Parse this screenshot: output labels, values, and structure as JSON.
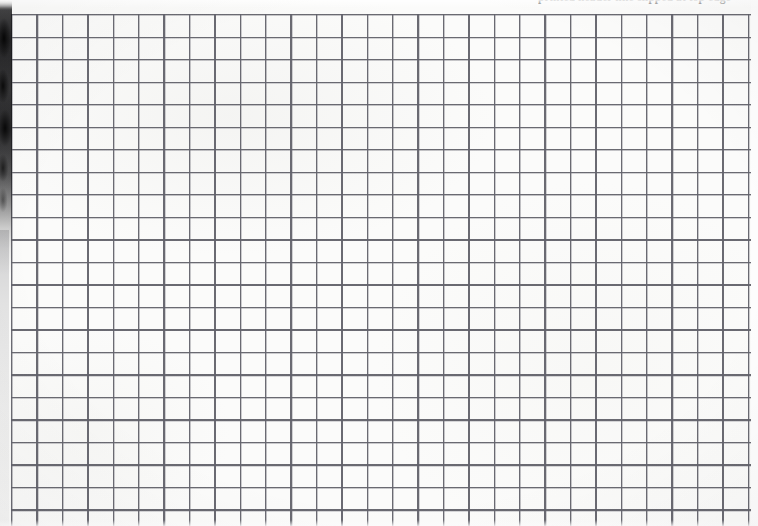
{
  "page": {
    "kind": "scanned-graph-paper",
    "width_px": 758,
    "height_px": 526,
    "paper_color": "#fbfbfa",
    "background_color": "#ffffff"
  },
  "header": {
    "clipped_text": "printed header line clipped at top edge",
    "legible": "false",
    "ink_color": "#3b3b3b"
  },
  "grid": {
    "line_color": "#54545c",
    "columns": 29,
    "rows": 23,
    "cell_width_px": 25.4,
    "cell_height_px": 22.52,
    "origin_x_px": 11,
    "origin_y_px": 14,
    "line_weight_px": 1.3
  },
  "artifacts": {
    "binding_shadow_label": "dark scan shadow along upper-left page edge",
    "binding_shadow_color": "#141416",
    "edge_gradient_label": "soft grey page edge continuing to bottom",
    "right_margin_label": "unruled right margin strip",
    "vignette_label": "scanner vignette"
  }
}
